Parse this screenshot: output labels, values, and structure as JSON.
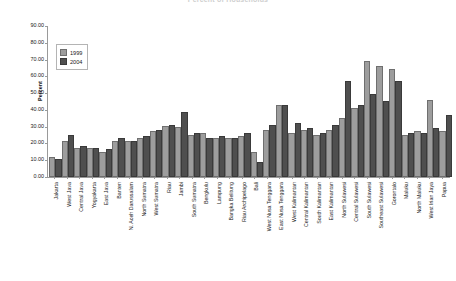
{
  "chart_data": {
    "type": "bar",
    "title": "Percent of Households",
    "xlabel": "",
    "ylabel": "Percent",
    "ylim": [
      0,
      90
    ],
    "ytick_step": 10,
    "ytick_labels": [
      "90.00",
      "80.00",
      "70.00",
      "60.00",
      "50.00",
      "40.00",
      "30.00",
      "20.00",
      "10.00",
      "0.00"
    ],
    "grid": false,
    "legend_position": "top-left",
    "categories": [
      "Jakarta",
      "West Java",
      "Central Java",
      "Yogyakarta",
      "East Java",
      "Banten",
      "N. Aceh Darussalam",
      "North Sumatra",
      "West Sumatra",
      "Riau",
      "Jambi",
      "South Sumatra",
      "Bengkulu",
      "Lampung",
      "Bangka Belitung",
      "Riau Archipelago",
      "Bali",
      "West Nusa Tenggara",
      "East Nusa Tenggara",
      "West Kalimantan",
      "Central Kalimantan",
      "South Kalimantan",
      "East Kalimantan",
      "North Sulawesi",
      "Central Sulawesi",
      "South Sulawesi",
      "Southeast Sulawesi",
      "Gorontalo",
      "Maluku",
      "North Maluku",
      "West Irian Jaya",
      "Papua"
    ],
    "series": [
      {
        "name": "1999",
        "color": "#9d9d9d",
        "values": [
          11.0,
          20.0,
          16.0,
          16.0,
          14.0,
          20.0,
          20.5,
          22.0,
          26.0,
          29.0,
          28.5,
          24.0,
          25.0,
          22.0,
          22.0,
          23.0,
          14.0,
          27.0,
          42.0,
          25.0,
          27.0,
          24.0,
          27.0,
          34.0,
          40.0,
          68.0,
          65.0,
          63.0,
          24.0,
          26.0,
          45.0,
          26.0
        ]
      },
      {
        "name": "2004",
        "color": "#4f4f4f",
        "values": [
          9.5,
          24.0,
          17.0,
          16.0,
          15.5,
          22.0,
          20.0,
          23.0,
          27.0,
          30.0,
          37.5,
          25.0,
          22.0,
          23.0,
          22.0,
          25.0,
          8.0,
          30.0,
          41.5,
          31.0,
          28.0,
          25.0,
          30.0,
          56.0,
          42.0,
          48.0,
          44.0,
          56.0,
          25.0,
          25.0,
          28.0,
          36.0
        ]
      }
    ]
  },
  "legend": {
    "entries": [
      {
        "label": "1999"
      },
      {
        "label": "2004"
      }
    ]
  }
}
